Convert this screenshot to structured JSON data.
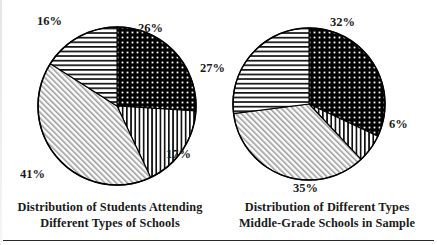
{
  "figure": {
    "title": "",
    "background": "#ffffff",
    "ink": "#000000"
  },
  "chart_data": [
    {
      "type": "pie",
      "id": "students-attending",
      "title": "Distribution of Students Attending Different Types of Schools",
      "title_lines": [
        "Distribution of Students Attending",
        "Different Types of Schools"
      ],
      "categories": [
        "Segment A",
        "Segment B",
        "Segment C",
        "Segment D"
      ],
      "values": [
        26,
        17,
        41,
        16
      ],
      "labels": [
        "26%",
        "17%",
        "41%",
        "16%"
      ],
      "units": "percent",
      "start_angle_deg": 0,
      "direction": "clockwise",
      "legend": "none",
      "grid": false,
      "patterns": [
        "grid-dark",
        "vertical-lines",
        "diagonal-hatch",
        "horizontal-lines"
      ]
    },
    {
      "type": "pie",
      "id": "middle-grade-schools",
      "title": "Distribution of Different Types Middle-Grade Schools in Sample",
      "title_lines": [
        "Distribution of Different Types",
        "Middle-Grade Schools in Sample"
      ],
      "categories": [
        "Segment A",
        "Segment B",
        "Segment C",
        "Segment D"
      ],
      "values": [
        32,
        6,
        35,
        27
      ],
      "labels": [
        "32%",
        "6%",
        "35%",
        "27%"
      ],
      "units": "percent",
      "start_angle_deg": 0,
      "direction": "clockwise",
      "legend": "none",
      "grid": false,
      "patterns": [
        "grid-dark",
        "vertical-lines",
        "diagonal-hatch",
        "horizontal-lines"
      ]
    }
  ],
  "left_chart": {
    "caption_line1": "Distribution of Students Attending",
    "caption_line2": "Different Types of Schools",
    "label_26": "26%",
    "label_17": "17%",
    "label_41": "41%",
    "label_16": "16%"
  },
  "right_chart": {
    "caption_line1": "Distribution of Different Types",
    "caption_line2": "Middle-Grade Schools in Sample",
    "label_32": "32%",
    "label_6": "6%",
    "label_35": "35%",
    "label_27": "27%"
  }
}
